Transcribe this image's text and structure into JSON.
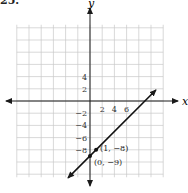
{
  "problem": {
    "number": "25."
  },
  "chart_data": {
    "type": "line",
    "title": "",
    "xlabel": "x",
    "ylabel": "y",
    "xlim": [
      -12,
      12
    ],
    "ylim": [
      -12,
      12
    ],
    "grid": true,
    "x_tick_labels": [
      "2",
      "4",
      "6"
    ],
    "x_ticks": [
      2,
      4,
      6
    ],
    "y_tick_labels": [
      "4",
      "2",
      "−2",
      "−4",
      "−6",
      "−8"
    ],
    "y_ticks": [
      4,
      2,
      -2,
      -4,
      -6,
      -8
    ],
    "series": [
      {
        "name": "y = x − 9",
        "slope": 1,
        "intercept": -9,
        "x": [
          -3.6,
          10.8
        ],
        "y": [
          -12.6,
          1.8
        ],
        "arrows": "both"
      }
    ],
    "points": [
      {
        "x": 1,
        "y": -8,
        "label": "(1, −8)"
      },
      {
        "x": 0,
        "y": -9,
        "label": "(0, −9)"
      }
    ],
    "colors": {
      "grid": "#c8c8c8",
      "axis": "#1a1a1a",
      "line": "#111111"
    }
  }
}
